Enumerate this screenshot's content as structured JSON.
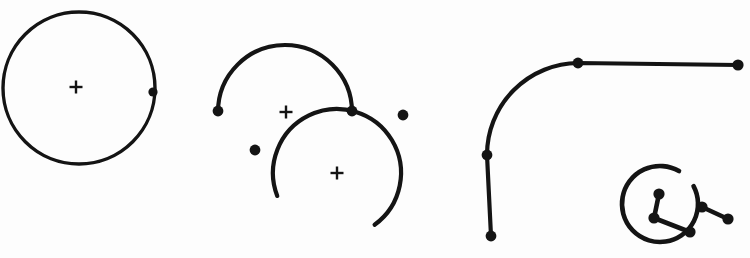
{
  "document": {
    "title": "Geometric arc and polyline construction drawing",
    "background_color": "#fdfdfd",
    "stroke_color": "#141414",
    "width": 750,
    "height": 258
  },
  "chart_data": {
    "type": "diagram",
    "xlabel": "",
    "ylabel": "",
    "grid": false,
    "legend": false,
    "xlim": [
      0,
      750
    ],
    "ylim": [
      0,
      258
    ],
    "groups": [
      {
        "name": "left-full-circle-group",
        "elements": [
          "circle-full-left",
          "node-circle-left-seam",
          "cross-center-left"
        ]
      },
      {
        "name": "middle-double-arc-group",
        "elements": [
          "arc-upper-middle",
          "arc-lower-middle",
          "cross-center-upper-middle",
          "cross-center-lower-middle"
        ]
      },
      {
        "name": "right-polyline-and-small-circle-group",
        "elements": [
          "polyline-right-corner",
          "arc-small-right",
          "polyline-small-inner",
          "segment-small-outer"
        ]
      }
    ],
    "shapes": [
      {
        "id": "circle-full-left",
        "kind": "circle",
        "cx": 79,
        "cy": 88,
        "r": 76,
        "start_angle_deg": 0,
        "end_angle_deg": 360,
        "stroke_width": 3.4,
        "closed": true
      },
      {
        "id": "arc-upper-middle",
        "kind": "arc",
        "cx": 285,
        "cy": 112,
        "r": 67,
        "start_angle_deg": 180,
        "end_angle_deg": 360,
        "sweep_deg": 180,
        "stroke_width": 4.2,
        "closed": false
      },
      {
        "id": "arc-lower-middle",
        "kind": "arc",
        "cx": 337,
        "cy": 173,
        "r": 64,
        "start_angle_deg": 159,
        "end_angle_deg": 414,
        "sweep_deg": 255,
        "stroke_width": 4.2,
        "closed": false
      },
      {
        "id": "polyline-right-corner",
        "kind": "polyline-with-fillet",
        "stroke_width": 4.2,
        "vertices": [
          {
            "x": 491,
            "y": 236,
            "label": "vertex-lower-end"
          },
          {
            "x": 487,
            "y": 155,
            "label": "vertex-tangent-lower"
          },
          {
            "x": 578,
            "y": 63,
            "label": "vertex-tangent-corner"
          },
          {
            "x": 738,
            "y": 65,
            "label": "vertex-right-end"
          }
        ],
        "fillet_radius": 92
      },
      {
        "id": "arc-small-right",
        "kind": "arc",
        "cx": 660,
        "cy": 204,
        "r": 38,
        "start_angle_deg": 332,
        "end_angle_deg": 660,
        "sweep_deg": 328,
        "stroke_width": 4.6,
        "closed": false
      },
      {
        "id": "polyline-small-inner",
        "kind": "polyline",
        "stroke_width": 4.6,
        "vertices": [
          {
            "x": 659,
            "y": 194,
            "label": "inner-node-top"
          },
          {
            "x": 654,
            "y": 218,
            "label": "inner-node-elbow"
          },
          {
            "x": 690,
            "y": 232,
            "label": "inner-node-end"
          }
        ]
      },
      {
        "id": "segment-small-outer",
        "kind": "polyline",
        "stroke_width": 4.6,
        "vertices": [
          {
            "x": 702,
            "y": 207,
            "label": "outer-node-start"
          },
          {
            "x": 728,
            "y": 219,
            "label": "outer-node-end"
          }
        ]
      }
    ],
    "nodes": [
      {
        "id": "node-circle-left-seam",
        "x": 153,
        "y": 92,
        "r": 4.6
      },
      {
        "id": "node-arc-upper-middle-left",
        "x": 218,
        "y": 111,
        "r": 5.4
      },
      {
        "id": "node-arc-upper-middle-right",
        "x": 352,
        "y": 111,
        "r": 5.4
      },
      {
        "id": "node-arc-lower-middle-start",
        "x": 255,
        "y": 150,
        "r": 5.4
      },
      {
        "id": "node-arc-lower-middle-end",
        "x": 403,
        "y": 115,
        "r": 5.4
      },
      {
        "id": "node-polyline-lower-end",
        "x": 491,
        "y": 236,
        "r": 5.4
      },
      {
        "id": "node-polyline-tangent-lower",
        "x": 487,
        "y": 155,
        "r": 5.4
      },
      {
        "id": "node-polyline-corner",
        "x": 578,
        "y": 63,
        "r": 5.4
      },
      {
        "id": "node-polyline-right-end",
        "x": 738,
        "y": 65,
        "r": 5.6
      },
      {
        "id": "node-small-inner-top",
        "x": 659,
        "y": 194,
        "r": 5.6
      },
      {
        "id": "node-small-inner-elbow",
        "x": 654,
        "y": 218,
        "r": 5.6
      },
      {
        "id": "node-small-inner-end",
        "x": 690,
        "y": 232,
        "r": 5.6
      },
      {
        "id": "node-small-outer-start",
        "x": 702,
        "y": 207,
        "r": 5.6
      },
      {
        "id": "node-small-outer-end",
        "x": 728,
        "y": 219,
        "r": 5.6
      }
    ],
    "center_markers": [
      {
        "id": "cross-center-left",
        "x": 76,
        "y": 87,
        "size": 13,
        "glyph": "+"
      },
      {
        "id": "cross-center-upper-middle",
        "x": 286,
        "y": 112,
        "size": 13,
        "glyph": "+"
      },
      {
        "id": "cross-center-lower-middle",
        "x": 337,
        "y": 173,
        "size": 13,
        "glyph": "+"
      }
    ]
  }
}
